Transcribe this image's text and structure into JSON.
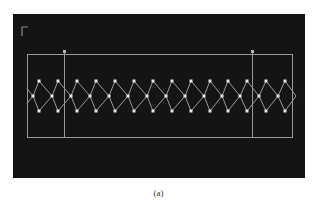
{
  "figure": {
    "caption": "(a)",
    "background_color": "#141414",
    "line_color": "#9a9a9a",
    "node_color": "#e6e6e6",
    "corner_mark": {
      "x": 22,
      "y": 27,
      "size": 6
    },
    "outer_rect": {
      "x": 27,
      "y": 54,
      "width": 265,
      "height": 83
    },
    "vertical_markers": [
      {
        "x": 64,
        "y1": 51,
        "y2": 137
      },
      {
        "x": 252,
        "y1": 51,
        "y2": 137
      }
    ],
    "lattice": {
      "top_y": 81,
      "mid_y": 96,
      "bottom_y": 111,
      "top_nodes_x": [
        39,
        58,
        77,
        96,
        115,
        134,
        153,
        172,
        191,
        210,
        228,
        247,
        266,
        285
      ],
      "mid_nodes_x": [
        33,
        52,
        71,
        90,
        109,
        128,
        147,
        166,
        185,
        204,
        222,
        240,
        259,
        278
      ],
      "left_edge_x": 27,
      "right_edge_x": 292
    }
  }
}
